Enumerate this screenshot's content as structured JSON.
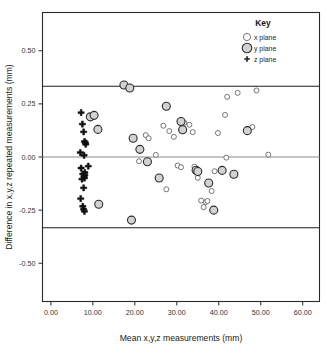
{
  "figure": {
    "background_color": "#ffffff",
    "frame_color": "#2a2a2a"
  },
  "legend": {
    "title": "Key",
    "entries": [
      {
        "label": "x plane",
        "marker": "small-open-circle",
        "color": "#ffffff"
      },
      {
        "label": "y plane",
        "marker": "large-gray-circle",
        "color": "#d2d2d2"
      },
      {
        "label": "z plane",
        "marker": "bold-plus-cross",
        "color": "#111111"
      }
    ]
  },
  "chart_data": {
    "type": "scatter",
    "title": "",
    "xlabel": "Mean x,y,z measurements (mm)",
    "ylabel": "Difference in x,y,z repeated measurements (mm)",
    "xlim": [
      -2.0,
      64.0
    ],
    "ylim": [
      -0.68,
      0.68
    ],
    "xticks": [
      0,
      10,
      20,
      30,
      40,
      50,
      60
    ],
    "xtick_labels": [
      "0.00",
      "10.00",
      "20.00",
      "30.00",
      "40.00",
      "50.00",
      "60.00"
    ],
    "yticks": [
      0.5,
      0.25,
      0.0,
      -0.25,
      -0.5
    ],
    "ytick_labels": [
      "0.50",
      "0.25",
      "0.00",
      "-0.25",
      "-0.50"
    ],
    "grid": false,
    "legend_position": "top-right",
    "reference_lines": [
      {
        "name": "upper-limit-of-agreement",
        "y": 0.333,
        "style": "solid-dark"
      },
      {
        "name": "mean-difference",
        "y": 0.0,
        "style": "solid-gray"
      },
      {
        "name": "lower-limit-of-agreement",
        "y": -0.333,
        "style": "solid-dark"
      }
    ],
    "series": [
      {
        "name": "x plane",
        "marker": "open-circle",
        "points": [
          [
            22.6,
            0.103
          ],
          [
            25.0,
            0.01
          ],
          [
            26.8,
            0.147
          ],
          [
            28.2,
            0.122
          ],
          [
            29.3,
            0.095
          ],
          [
            30.2,
            -0.04
          ],
          [
            31.8,
            0.161
          ],
          [
            33.0,
            0.152
          ],
          [
            33.8,
            0.117
          ],
          [
            34.2,
            -0.045
          ],
          [
            35.0,
            -0.098
          ],
          [
            35.8,
            -0.205
          ],
          [
            36.4,
            -0.236
          ],
          [
            36.9,
            -0.212
          ],
          [
            37.3,
            -0.207
          ],
          [
            38.3,
            -0.16
          ],
          [
            39.0,
            -0.067
          ],
          [
            39.8,
            0.113
          ],
          [
            41.5,
            0.198
          ],
          [
            41.8,
            -0.003
          ],
          [
            42.0,
            0.283
          ],
          [
            44.5,
            0.302
          ],
          [
            48.0,
            0.141
          ],
          [
            49.0,
            0.313
          ],
          [
            51.8,
            0.011
          ],
          [
            21.0,
            -0.02
          ],
          [
            27.5,
            -0.152
          ],
          [
            31.0,
            -0.048
          ],
          [
            23.3,
            0.088
          ]
        ]
      },
      {
        "name": "y plane",
        "marker": "gray-circle",
        "points": [
          [
            9.4,
            0.189
          ],
          [
            10.3,
            0.196
          ],
          [
            11.2,
            0.13
          ],
          [
            11.4,
            -0.222
          ],
          [
            17.4,
            0.339
          ],
          [
            18.8,
            0.325
          ],
          [
            19.2,
            -0.297
          ],
          [
            19.6,
            0.088
          ],
          [
            21.2,
            0.036
          ],
          [
            23.0,
            -0.022
          ],
          [
            25.8,
            -0.099
          ],
          [
            27.5,
            0.239
          ],
          [
            31.0,
            0.167
          ],
          [
            31.4,
            0.128
          ],
          [
            34.6,
            -0.062
          ],
          [
            35.0,
            -0.068
          ],
          [
            37.6,
            -0.122
          ],
          [
            38.8,
            -0.25
          ],
          [
            40.8,
            -0.063
          ],
          [
            43.6,
            -0.081
          ],
          [
            46.8,
            0.124
          ]
        ]
      },
      {
        "name": "z plane",
        "marker": "plus-cross",
        "points": [
          [
            7.2,
            0.209
          ],
          [
            7.5,
            0.155
          ],
          [
            7.8,
            0.118
          ],
          [
            8.0,
            0.073
          ],
          [
            8.2,
            0.068
          ],
          [
            8.3,
            0.06
          ],
          [
            7.0,
            0.021
          ],
          [
            7.9,
            0.008
          ],
          [
            7.2,
            -0.052
          ],
          [
            8.9,
            -0.043
          ],
          [
            7.6,
            -0.08
          ],
          [
            8.1,
            -0.085
          ],
          [
            7.9,
            -0.092
          ],
          [
            8.0,
            -0.099
          ],
          [
            7.8,
            -0.145
          ],
          [
            7.1,
            -0.196
          ],
          [
            7.6,
            -0.232
          ],
          [
            7.8,
            -0.246
          ],
          [
            8.0,
            -0.256
          ],
          [
            8.1,
            -0.073
          ],
          [
            7.4,
            -0.104
          ]
        ]
      }
    ]
  }
}
